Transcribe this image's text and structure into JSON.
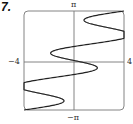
{
  "problem_number": "7.",
  "chart_data": {
    "type": "line",
    "title": "",
    "xlabel": "",
    "ylabel": "",
    "xlim": [
      -4,
      4
    ],
    "ylim": [
      -3.14159,
      3.14159
    ],
    "x_tick_labels": [
      "−4",
      "4"
    ],
    "y_tick_labels": [
      "π",
      "−π"
    ],
    "grid": false,
    "curve": "x = (4/π)·t − 2.5·sin(3t), y = t, t ∈ [−π, π]",
    "sample_points": [
      {
        "x": -4.0,
        "y": -3.14
      },
      {
        "x": -1.5,
        "y": -2.6
      },
      {
        "x": -3.6,
        "y": -1.5
      },
      {
        "x": 0.1,
        "y": -0.7
      },
      {
        "x": 1.4,
        "y": -0.4
      },
      {
        "x": 0,
        "y": 0
      },
      {
        "x": -1.4,
        "y": 0.4
      },
      {
        "x": 3.6,
        "y": 1.5
      },
      {
        "x": 1.5,
        "y": 2.6
      },
      {
        "x": 4.0,
        "y": 3.14
      }
    ]
  },
  "labels": {
    "xmin": "−4",
    "xmax": "4",
    "ymax": "π",
    "ymin": "−π"
  }
}
